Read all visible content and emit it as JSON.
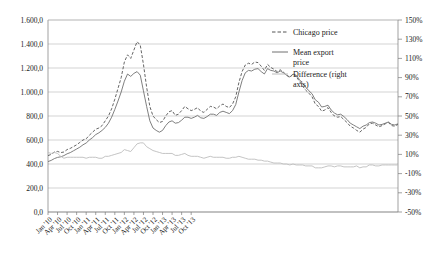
{
  "chart_data": {
    "type": "line",
    "title": "",
    "xlabel": "",
    "ylabel": "",
    "grid": true,
    "legend_position": "inside-top-right",
    "x_tick_labels": [
      "Jan '10",
      "Apr '10",
      "Jul '10",
      "Oct '10",
      "Jan '11",
      "Apr '11",
      "Jul '11",
      "Oct '11",
      "Jan '12",
      "Apr '12",
      "Jul '12",
      "Oct '12",
      "Jan '13",
      "Apr '13",
      "Jul '13",
      "Oct '13"
    ],
    "y_left_ticks": [
      "0,0",
      "200,0",
      "400,0",
      "600,0",
      "800,0",
      "1.000,0",
      "1.200,0",
      "1.400,0",
      "1.600,0"
    ],
    "y_right_ticks": [
      "-50%",
      "-30%",
      "-10%",
      "10%",
      "30%",
      "50%",
      "70%",
      "90%",
      "110%",
      "130%",
      "150%"
    ],
    "ylim_left": [
      0,
      1600
    ],
    "ylim_right": [
      -50,
      150
    ],
    "x_range_months": [
      "2010-01",
      "2013-11"
    ],
    "series": [
      {
        "name": "Chicago price",
        "axis": "left",
        "style": "dashed",
        "color": "#555555",
        "values": [
          470,
          480,
          500,
          505,
          495,
          500,
          520,
          530,
          545,
          560,
          580,
          600,
          610,
          640,
          665,
          690,
          700,
          720,
          760,
          800,
          860,
          940,
          1030,
          1120,
          1250,
          1310,
          1280,
          1350,
          1420,
          1390,
          1230,
          1040,
          880,
          800,
          770,
          745,
          755,
          800,
          835,
          845,
          805,
          815,
          845,
          880,
          860,
          845,
          855,
          870,
          840,
          830,
          855,
          880,
          875,
          860,
          885,
          900,
          880,
          870,
          900,
          960,
          1080,
          1170,
          1225,
          1240,
          1230,
          1250,
          1245,
          1215,
          1180,
          1230,
          1205,
          1190,
          1170,
          1185,
          1165,
          1140,
          1120,
          1150,
          1130,
          1090,
          1050,
          1015,
          990,
          960,
          900,
          880,
          840,
          850,
          870,
          830,
          800,
          790,
          795,
          770,
          745,
          715,
          700,
          680,
          665,
          690,
          705,
          735,
          740,
          725,
          710,
          720,
          735,
          745,
          720,
          715,
          730
        ]
      },
      {
        "name": "Mean export price",
        "axis": "left",
        "style": "solid",
        "color": "#707070",
        "values": [
          420,
          430,
          445,
          455,
          460,
          470,
          485,
          495,
          510,
          525,
          540,
          560,
          575,
          600,
          620,
          645,
          660,
          680,
          705,
          740,
          790,
          855,
          925,
          1000,
          1090,
          1150,
          1130,
          1155,
          1170,
          1140,
          1010,
          880,
          760,
          700,
          680,
          665,
          680,
          720,
          750,
          760,
          740,
          745,
          765,
          790,
          790,
          780,
          790,
          805,
          785,
          780,
          795,
          815,
          815,
          805,
          830,
          840,
          830,
          820,
          845,
          895,
          1000,
          1095,
          1160,
          1180,
          1175,
          1190,
          1195,
          1170,
          1150,
          1195,
          1180,
          1175,
          1160,
          1175,
          1160,
          1140,
          1125,
          1150,
          1140,
          1105,
          1070,
          1040,
          1010,
          985,
          935,
          915,
          875,
          880,
          890,
          850,
          825,
          810,
          815,
          795,
          770,
          740,
          725,
          710,
          695,
          715,
          725,
          745,
          750,
          740,
          725,
          730,
          740,
          750,
          730,
          725,
          735
        ]
      },
      {
        "name": "Difference (right axis)",
        "axis": "right",
        "style": "solid-light",
        "color": "#bdbdbd",
        "values": [
          12,
          11,
          12,
          11,
          8,
          6,
          7,
          7,
          7,
          7,
          7,
          7,
          6,
          7,
          7,
          7,
          6,
          6,
          8,
          8,
          9,
          10,
          11,
          12,
          15,
          14,
          13,
          17,
          21,
          22,
          22,
          18,
          16,
          14,
          13,
          12,
          11,
          11,
          11,
          11,
          9,
          9,
          10,
          11,
          9,
          8,
          8,
          8,
          7,
          6,
          7,
          8,
          7,
          7,
          7,
          7,
          6,
          6,
          7,
          7,
          8,
          7,
          6,
          5,
          5,
          5,
          4,
          4,
          3,
          3,
          2,
          1,
          1,
          1,
          0,
          0,
          -1,
          0,
          -1,
          -1,
          -1,
          -2,
          -2,
          -2,
          -4,
          -4,
          -4,
          -3,
          -2,
          -2,
          -3,
          -2,
          -2,
          -3,
          -3,
          -3,
          -3,
          -2,
          -4,
          -3,
          -3,
          -1,
          -1,
          -2,
          -2,
          -1,
          -1,
          -1,
          -1,
          -1,
          -1
        ]
      }
    ]
  },
  "legend": {
    "items": [
      {
        "label": "Chicago price",
        "style": "dashed"
      },
      {
        "label": "Mean export price",
        "style": "solid"
      },
      {
        "label": "Difference (right axis)",
        "style": "solid-light"
      }
    ]
  }
}
